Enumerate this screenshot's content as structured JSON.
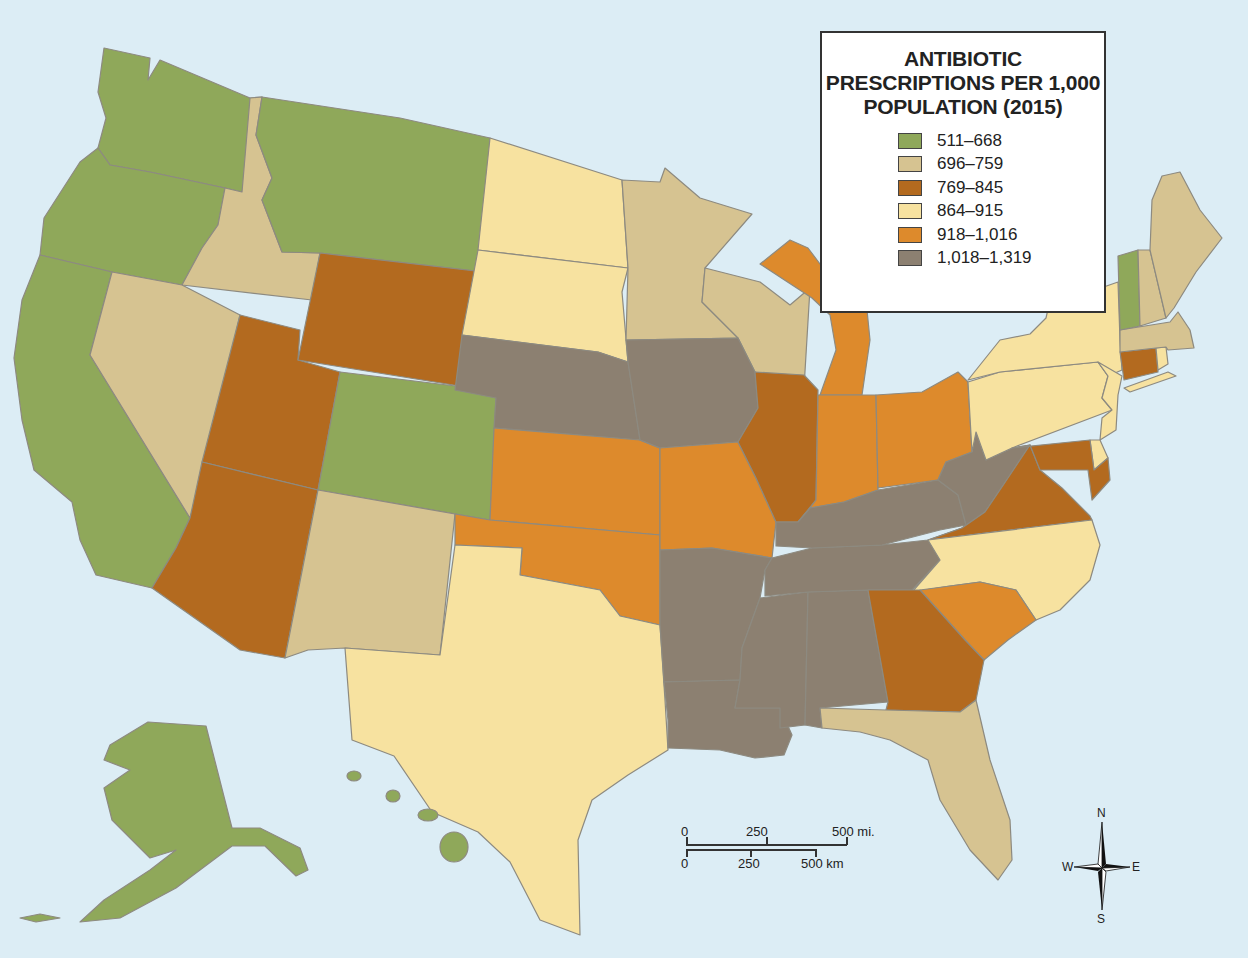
{
  "title_lines": [
    "ANTIBIOTIC",
    "PRESCRIPTIONS PER 1,000",
    "POPULATION (2015)"
  ],
  "legend": [
    {
      "label": "511–668",
      "color": "#8fa85a",
      "key": "c1"
    },
    {
      "label": "696–759",
      "color": "#d6c391",
      "key": "c2"
    },
    {
      "label": "769–845",
      "color": "#b36a1f",
      "key": "c3"
    },
    {
      "label": "864–915",
      "color": "#f7e2a0",
      "key": "c4"
    },
    {
      "label": "918–1,016",
      "color": "#dd8a2c",
      "key": "c5"
    },
    {
      "label": "1,018–1,319",
      "color": "#8c8071",
      "key": "c6"
    }
  ],
  "water_color": "#dcedf5",
  "states": {
    "WA": "c1",
    "OR": "c1",
    "CA": "c1",
    "MT": "c1",
    "CO": "c1",
    "AK": "c1",
    "HI": "c1",
    "VT": "c1",
    "ID": "c2",
    "NV": "c2",
    "NM": "c2",
    "MN": "c2",
    "WI": "c2",
    "FL": "c2",
    "ME": "c2",
    "NH": "c2",
    "MA": "c2",
    "WY": "c3",
    "UT": "c3",
    "AZ": "c3",
    "IL": "c3",
    "VA": "c3",
    "MD": "c3",
    "GA": "c3",
    "CT": "c3",
    "ND": "c4",
    "SD": "c4",
    "TX": "c4",
    "NY": "c4",
    "PA": "c4",
    "NJ": "c4",
    "DE": "c4",
    "NC": "c4",
    "RI": "c4",
    "KS": "c5",
    "OK": "c5",
    "MO": "c5",
    "IN": "c5",
    "OH": "c5",
    "MI": "c5",
    "SC": "c5",
    "NE": "c6",
    "IA": "c6",
    "AR": "c6",
    "LA": "c6",
    "MS": "c6",
    "AL": "c6",
    "TN": "c6",
    "KY": "c6",
    "WV": "c6"
  },
  "scale_bar": {
    "miles": {
      "ticks": [
        "0",
        "250",
        "500 mi."
      ]
    },
    "km": {
      "ticks": [
        "0",
        "250",
        "500 km"
      ]
    }
  },
  "compass": {
    "n": "N",
    "s": "S",
    "e": "E",
    "w": "W"
  }
}
